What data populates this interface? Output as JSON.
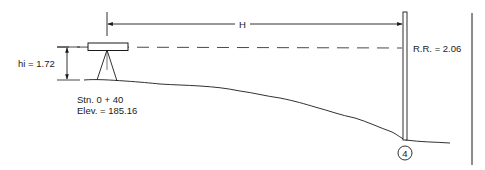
{
  "diagram": {
    "type": "differential-leveling-sketch",
    "labels": {
      "horizontal_distance": "H",
      "instrument_height": "hi = 1.72",
      "rod_reading": "R.R. = 2.06",
      "station": "Stn. 0 + 40",
      "elevation": "Elev. = 185.16",
      "point_number": "4"
    },
    "values": {
      "hi": 1.72,
      "rod_reading": 2.06,
      "station": "0 + 40",
      "elevation": 185.16,
      "point": 4
    },
    "colors": {
      "line": "#1a1a1a",
      "background": "#ffffff"
    }
  }
}
